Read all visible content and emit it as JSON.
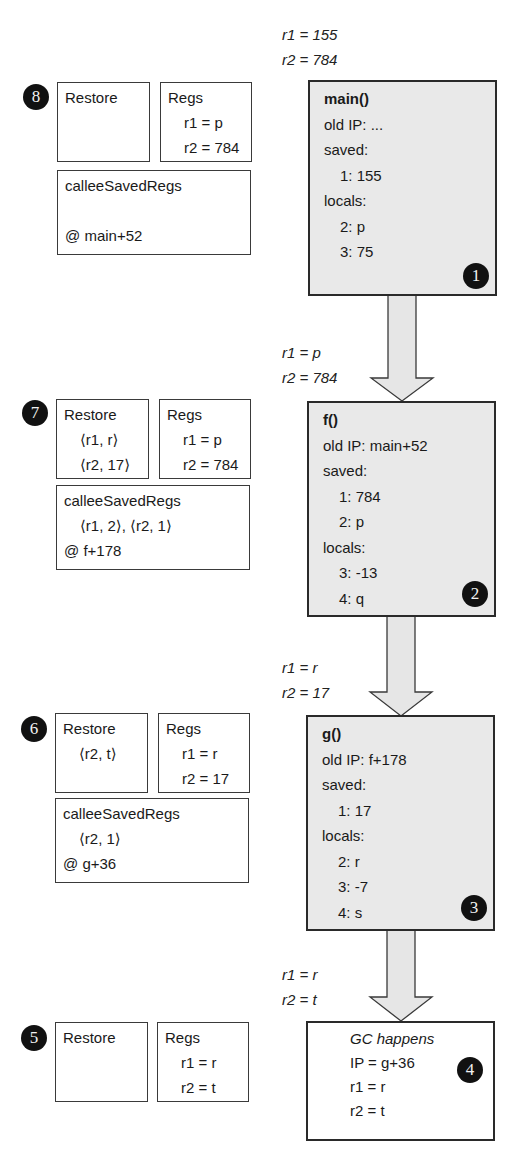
{
  "diagram": {
    "stack_frames": [
      {
        "step": "1",
        "title": "main()",
        "old_ip": "old IP: ...",
        "saved_label": "saved:",
        "saved": [
          "1: 155"
        ],
        "locals_label": "locals:",
        "locals": [
          "2: p",
          "3: 75"
        ],
        "incoming_regs": [
          "r1 = 155",
          "r2 = 784"
        ]
      },
      {
        "step": "2",
        "title": "f()",
        "old_ip": "old IP: main+52",
        "saved_label": "saved:",
        "saved": [
          "1: 784",
          "2: p"
        ],
        "locals_label": "locals:",
        "locals": [
          "3: -13",
          "4: q"
        ],
        "incoming_regs": [
          "r1 = p",
          "r2 = 784"
        ]
      },
      {
        "step": "3",
        "title": "g()",
        "old_ip": "old IP: f+178",
        "saved_label": "saved:",
        "saved": [
          "1: 17"
        ],
        "locals_label": "locals:",
        "locals": [
          "2: r",
          "3: -7",
          "4: s"
        ],
        "incoming_regs": [
          "r1 = r",
          "r2 = 17"
        ]
      }
    ],
    "gc_event": {
      "step": "4",
      "title": "GC happens",
      "ip": "IP = g+36",
      "r1": "r1 = r",
      "r2": "r2 = t",
      "incoming_regs": [
        "r1 = r",
        "r2 = t"
      ]
    },
    "unwind_steps": [
      {
        "step": "8",
        "restore_label": "Restore",
        "restore": [],
        "regs_label": "Regs",
        "regs": [
          "r1 = p",
          "r2 = 784"
        ],
        "callee_label": "calleeSavedRegs",
        "callee": "",
        "at": "@ main+52"
      },
      {
        "step": "7",
        "restore_label": "Restore",
        "restore": [
          "⟨r1, r⟩",
          "⟨r2, 17⟩"
        ],
        "regs_label": "Regs",
        "regs": [
          "r1 = p",
          "r2 = 784"
        ],
        "callee_label": "calleeSavedRegs",
        "callee": "⟨r1, 2⟩, ⟨r2, 1⟩",
        "at": "@ f+178"
      },
      {
        "step": "6",
        "restore_label": "Restore",
        "restore": [
          "⟨r2, t⟩"
        ],
        "regs_label": "Regs",
        "regs": [
          "r1 = r",
          "r2 = 17"
        ],
        "callee_label": "calleeSavedRegs",
        "callee": "⟨r2, 1⟩",
        "at": "@ g+36"
      },
      {
        "step": "5",
        "restore_label": "Restore",
        "restore": [],
        "regs_label": "Regs",
        "regs": [
          "r1 = r",
          "r2 = t"
        ]
      }
    ],
    "colors": {
      "frame_fill": "#e9e9e9",
      "arrow_fill": "#e6e6e6",
      "border": "#2a2a2a",
      "badge": "#111111"
    }
  }
}
